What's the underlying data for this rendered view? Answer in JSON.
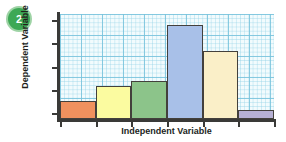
{
  "badge": {
    "name": "step-badge",
    "number": "2",
    "fill_color": "#3da855",
    "ring_color": "#9ed3a5",
    "text_color": "#ffffff"
  },
  "chart_data": {
    "type": "bar",
    "title": "",
    "subtitle": "",
    "xlabel": "Independent Variable",
    "ylabel": "Dependent Variable",
    "categories": [
      "1",
      "2",
      "3",
      "4",
      "5",
      "6"
    ],
    "values": [
      18,
      33,
      38,
      94,
      68,
      9
    ],
    "ylim": [
      0,
      105
    ],
    "grid": true,
    "grid_style": "graph-paper",
    "grid_color": "#78c3dc",
    "grid_background": "#f2fbfd",
    "legend": false,
    "legend_position": "none",
    "axis_tick_labels_shown": false,
    "y_tick_count": 5,
    "x_tick_count": 7,
    "axis_color": "#3a3a38",
    "bar_border_color": "#43403c",
    "bar_colors": [
      "#f0915e",
      "#fbfba0",
      "#8cc48a",
      "#a8c0e8",
      "#faefc8",
      "#b6b0d4"
    ],
    "bar_names": [
      "bar-orange",
      "bar-yellow",
      "bar-green",
      "bar-blue",
      "bar-cream",
      "bar-purple"
    ]
  }
}
